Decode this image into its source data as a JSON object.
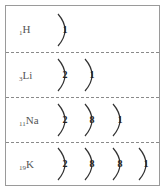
{
  "diagram": {
    "title": "",
    "elements": [
      {
        "atomic_number": "1",
        "symbol": "H",
        "shells": [
          "1"
        ]
      },
      {
        "atomic_number": "3",
        "symbol": "Li",
        "shells": [
          "2",
          "1"
        ]
      },
      {
        "atomic_number": "11",
        "symbol": "Na",
        "shells": [
          "2",
          "8",
          "1"
        ]
      },
      {
        "atomic_number": "19",
        "symbol": "K",
        "shells": [
          "2",
          "8",
          "8",
          "1"
        ]
      }
    ]
  }
}
